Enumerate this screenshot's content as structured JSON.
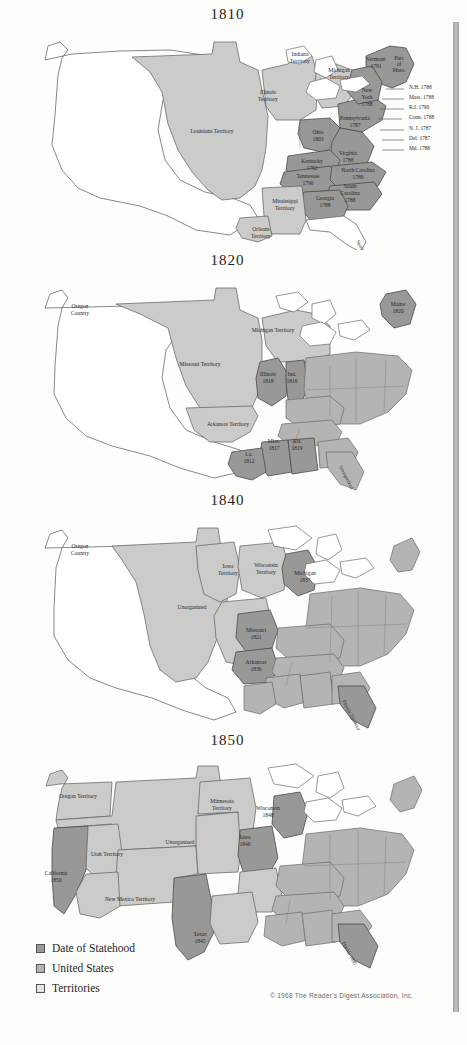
{
  "document": {
    "type": "historical-map-series",
    "subject": "Growth of the United States: statehood and territories",
    "copyright": "© 1968 The Reader's Digest Association, Inc."
  },
  "legend": {
    "items": [
      {
        "label": "Date of Statehood",
        "color": "#989896",
        "key": "state-date"
      },
      {
        "label": "United States",
        "color": "#b4b4b2",
        "key": "us"
      },
      {
        "label": "Territories",
        "color": "#cbcbc9",
        "key": "territory"
      }
    ]
  },
  "maps": [
    {
      "id": "map-1810",
      "title": "1810",
      "labels": [
        {
          "text": "Indiana",
          "x": 300,
          "y": 36,
          "cls": "state-date-area"
        },
        {
          "text": "Territory",
          "x": 300,
          "y": 43
        },
        {
          "text": "Michigan",
          "x": 339,
          "y": 52
        },
        {
          "text": "Territory",
          "x": 339,
          "y": 59
        },
        {
          "text": "Illinois",
          "x": 268,
          "y": 74
        },
        {
          "text": "Territory",
          "x": 268,
          "y": 81
        },
        {
          "text": "Louisiana Territory",
          "x": 212,
          "y": 113
        },
        {
          "text": "Ohio",
          "x": 318,
          "y": 114
        },
        {
          "text": "1803",
          "x": 318,
          "y": 121
        },
        {
          "text": "Pennsylvania",
          "x": 355,
          "y": 100
        },
        {
          "text": "1787",
          "x": 355,
          "y": 107
        },
        {
          "text": "Virginia",
          "x": 348,
          "y": 135
        },
        {
          "text": "1788",
          "x": 348,
          "y": 142
        },
        {
          "text": "Kentucky",
          "x": 312,
          "y": 143
        },
        {
          "text": "1792",
          "x": 312,
          "y": 150
        },
        {
          "text": "Tennessee",
          "x": 308,
          "y": 158
        },
        {
          "text": "1796",
          "x": 308,
          "y": 165
        },
        {
          "text": "North Carolina",
          "x": 358,
          "y": 152
        },
        {
          "text": "1789",
          "x": 358,
          "y": 159
        },
        {
          "text": "South",
          "x": 350,
          "y": 168
        },
        {
          "text": "Carolina",
          "x": 350,
          "y": 175
        },
        {
          "text": "1788",
          "x": 350,
          "y": 182
        },
        {
          "text": "Georgia",
          "x": 325,
          "y": 180
        },
        {
          "text": "1788",
          "x": 325,
          "y": 187
        },
        {
          "text": "Mississippi",
          "x": 285,
          "y": 183
        },
        {
          "text": "Territory",
          "x": 285,
          "y": 190
        },
        {
          "text": "Orleans",
          "x": 261,
          "y": 211
        },
        {
          "text": "Territory",
          "x": 261,
          "y": 218
        },
        {
          "text": "Vermont",
          "x": 376,
          "y": 41
        },
        {
          "text": "1791",
          "x": 376,
          "y": 48
        },
        {
          "text": "Part",
          "x": 399,
          "y": 40
        },
        {
          "text": "of",
          "x": 399,
          "y": 46
        },
        {
          "text": "Mass.",
          "x": 399,
          "y": 52
        },
        {
          "text": "New",
          "x": 367,
          "y": 72
        },
        {
          "text": "York",
          "x": 367,
          "y": 79
        },
        {
          "text": "1788",
          "x": 367,
          "y": 86
        },
        {
          "text": "Spanish",
          "x": 360,
          "y": 228,
          "rotate": 62
        }
      ],
      "callouts": [
        {
          "text": "N.H. 1788",
          "x": 409,
          "y": 69
        },
        {
          "text": "Mass. 1788",
          "x": 409,
          "y": 79
        },
        {
          "text": "R.I. 1790",
          "x": 409,
          "y": 89
        },
        {
          "text": "Conn. 1788",
          "x": 409,
          "y": 99
        },
        {
          "text": "N. J. 1787",
          "x": 409,
          "y": 110
        },
        {
          "text": "Del. 1787",
          "x": 409,
          "y": 120
        },
        {
          "text": "Md. 1788",
          "x": 409,
          "y": 130
        }
      ]
    },
    {
      "id": "map-1820",
      "title": "1820",
      "labels": [
        {
          "text": "Oregon",
          "x": 80,
          "y": 42
        },
        {
          "text": "Country",
          "x": 80,
          "y": 49
        },
        {
          "text": "Missouri Territory",
          "x": 200,
          "y": 100
        },
        {
          "text": "Michigan Territory",
          "x": 273,
          "y": 66
        },
        {
          "text": "Illinois",
          "x": 268,
          "y": 110
        },
        {
          "text": "1818",
          "x": 268,
          "y": 117
        },
        {
          "text": "Ind.",
          "x": 292,
          "y": 110
        },
        {
          "text": "1816",
          "x": 292,
          "y": 117
        },
        {
          "text": "Arkansas Territory",
          "x": 228,
          "y": 160
        },
        {
          "text": "Miss.",
          "x": 274,
          "y": 177
        },
        {
          "text": "1817",
          "x": 274,
          "y": 184
        },
        {
          "text": "Ala.",
          "x": 297,
          "y": 177
        },
        {
          "text": "1819",
          "x": 297,
          "y": 184
        },
        {
          "text": "La.",
          "x": 249,
          "y": 190
        },
        {
          "text": "1812",
          "x": 249,
          "y": 197
        },
        {
          "text": "Maine",
          "x": 398,
          "y": 40
        },
        {
          "text": "1820",
          "x": 398,
          "y": 47
        },
        {
          "text": "Unorganized",
          "x": 345,
          "y": 212,
          "rotate": 62
        }
      ],
      "callouts": []
    },
    {
      "id": "map-1840",
      "title": "1840",
      "labels": [
        {
          "text": "Oregon",
          "x": 80,
          "y": 42
        },
        {
          "text": "Country",
          "x": 80,
          "y": 49
        },
        {
          "text": "Iowa",
          "x": 228,
          "y": 62
        },
        {
          "text": "Territory",
          "x": 228,
          "y": 69
        },
        {
          "text": "Wisconsin",
          "x": 266,
          "y": 61
        },
        {
          "text": "Territory",
          "x": 266,
          "y": 68
        },
        {
          "text": "Michigan",
          "x": 305,
          "y": 69
        },
        {
          "text": "1837",
          "x": 305,
          "y": 76
        },
        {
          "text": "Unorganized",
          "x": 192,
          "y": 103
        },
        {
          "text": "Missouri",
          "x": 256,
          "y": 126
        },
        {
          "text": "1821",
          "x": 256,
          "y": 133
        },
        {
          "text": "Arkansas",
          "x": 256,
          "y": 158
        },
        {
          "text": "1836",
          "x": 256,
          "y": 165
        },
        {
          "text": "Florida Territory",
          "x": 350,
          "y": 210,
          "rotate": 62
        }
      ],
      "callouts": []
    },
    {
      "id": "map-1850",
      "title": "1850",
      "labels": [
        {
          "text": "Oregon Territory",
          "x": 78,
          "y": 52
        },
        {
          "text": "Minnesota",
          "x": 222,
          "y": 57
        },
        {
          "text": "Territory",
          "x": 222,
          "y": 64
        },
        {
          "text": "Wisconsin",
          "x": 268,
          "y": 64
        },
        {
          "text": "1848",
          "x": 268,
          "y": 71
        },
        {
          "text": "Iowa",
          "x": 245,
          "y": 93
        },
        {
          "text": "1846",
          "x": 245,
          "y": 100
        },
        {
          "text": "Unorganized",
          "x": 180,
          "y": 98
        },
        {
          "text": "Utah Territory",
          "x": 107,
          "y": 110
        },
        {
          "text": "California",
          "x": 56,
          "y": 129
        },
        {
          "text": "1850",
          "x": 56,
          "y": 136
        },
        {
          "text": "New Mexico Territory",
          "x": 130,
          "y": 155
        },
        {
          "text": "Texas",
          "x": 200,
          "y": 190
        },
        {
          "text": "1845",
          "x": 200,
          "y": 197
        },
        {
          "text": "Florida 1845",
          "x": 348,
          "y": 208,
          "rotate": 62
        }
      ],
      "callouts": []
    }
  ]
}
